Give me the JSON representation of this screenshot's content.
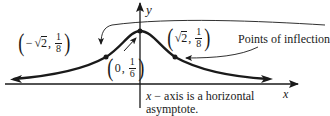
{
  "diagram": {
    "axes": {
      "x_label": "x",
      "y_label": "y"
    },
    "points": {
      "left_inflection": {
        "sign": "−",
        "x_radicand": "2",
        "y_num": "1",
        "y_den": "8",
        "sep": ","
      },
      "right_inflection": {
        "sign": "",
        "x_radicand": "2",
        "y_num": "1",
        "y_den": "8",
        "sep": ","
      },
      "maximum": {
        "x": "0",
        "y_num": "1",
        "y_den": "6",
        "sep": ","
      }
    },
    "annotations": {
      "inflection_label": "Points of inflection",
      "asymptote_line1_var": "x",
      "asymptote_line1_rest": " − axis is a horizontal",
      "asymptote_line2": "asymptote."
    },
    "colors": {
      "ink": "#1a1a1a",
      "background": "#ffffff"
    }
  }
}
